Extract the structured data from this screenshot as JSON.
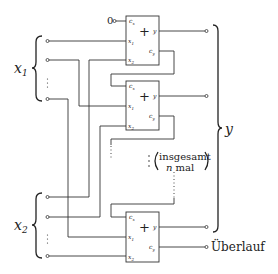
{
  "diagram": {
    "type": "ripple-carry-adder",
    "carry_in_value": "0",
    "input_groups": [
      {
        "label": "x",
        "subscript": "1"
      },
      {
        "label": "x",
        "subscript": "2"
      }
    ],
    "output_label": "y",
    "overflow_label": "Überlauf",
    "repeat_note": {
      "line1": "insgesamt",
      "line2_var": "n",
      "line2_text": "mal"
    },
    "adder": {
      "symbol": "+",
      "pins": {
        "cx": {
          "base": "c",
          "sub": "x"
        },
        "x1": {
          "base": "x",
          "sub": "1"
        },
        "x2": {
          "base": "x",
          "sub": "2"
        },
        "y": {
          "base": "y",
          "sub": ""
        },
        "cy": {
          "base": "c",
          "sub": "y"
        }
      }
    },
    "adders": [
      {
        "id": "adder-1"
      },
      {
        "id": "adder-2"
      },
      {
        "id": "adder-n"
      }
    ]
  }
}
